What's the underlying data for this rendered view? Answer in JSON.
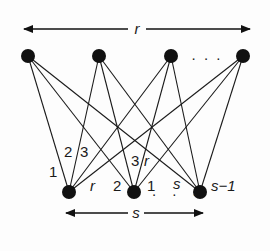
{
  "diagram": {
    "type": "complete bipartite graph",
    "top_arrow_label": "r",
    "bottom_arrow_label": "s",
    "top_ellipsis": ". . .",
    "bottom_ellipsis": ". . .",
    "top_nodes": [
      {
        "id": "t1",
        "x": 28,
        "y": 56
      },
      {
        "id": "t2",
        "x": 99,
        "y": 56
      },
      {
        "id": "t3",
        "x": 171,
        "y": 56
      },
      {
        "id": "t4",
        "x": 243,
        "y": 56
      }
    ],
    "bottom_nodes": [
      {
        "id": "b1",
        "x": 69,
        "y": 192
      },
      {
        "id": "b2",
        "x": 134,
        "y": 192
      },
      {
        "id": "b3",
        "x": 200,
        "y": 192
      }
    ],
    "edge_labels": {
      "b1_label_1": "1",
      "b1_label_2": "2",
      "b1_label_3": "3",
      "b1_label_r": "r",
      "b2_label_2": "2",
      "b2_label_3": "3",
      "b2_label_r": "r",
      "b2_label_1": "1",
      "b3_label_s": "s",
      "b3_label_s_minus_1": "s−1"
    },
    "colors": {
      "ink": "#111111",
      "background": "#fdfdfd"
    }
  }
}
